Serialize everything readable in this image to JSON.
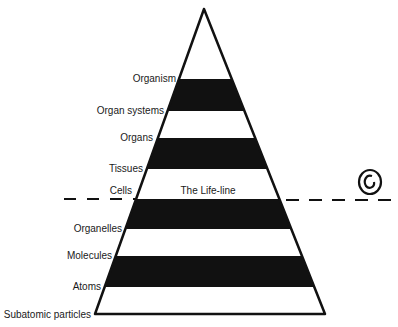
{
  "diagram": {
    "title": "",
    "life_line_label": "The Life-line",
    "levels": [
      {
        "label": "Organism",
        "fill": "#ffffff"
      },
      {
        "label": "Organ systems",
        "fill": "#111111"
      },
      {
        "label": "Organs",
        "fill": "#ffffff"
      },
      {
        "label": "Tissues",
        "fill": "#111111"
      },
      {
        "label": "Cells",
        "fill": "#ffffff"
      },
      {
        "label": "Organelles",
        "fill": "#111111"
      },
      {
        "label": "Molecules",
        "fill": "#ffffff"
      },
      {
        "label": "Atoms",
        "fill": "#111111"
      },
      {
        "label": "Subatomic particles",
        "fill": "#ffffff"
      }
    ],
    "symbol": "spiral-icon",
    "colors": {
      "dark": "#111111",
      "light": "#ffffff",
      "outline": "#111111"
    }
  }
}
